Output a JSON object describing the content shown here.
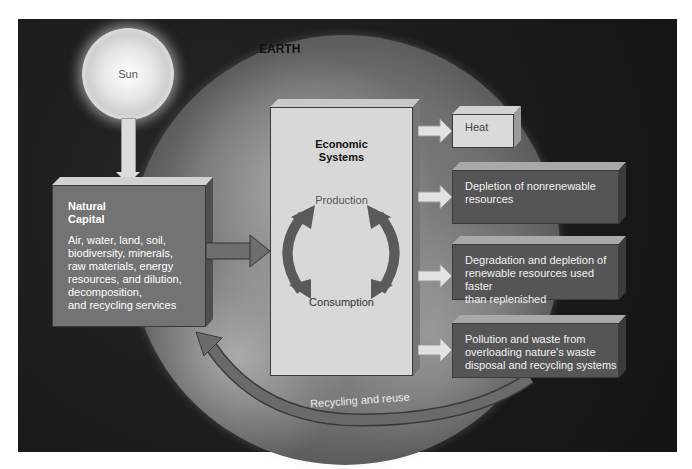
{
  "labels": {
    "sun": "Sun",
    "earth": "EARTH",
    "natural_capital": {
      "title": "Natural\nCapital",
      "title_line1": "Natural",
      "title_line2": "Capital",
      "description": "Air, water, land, soil,\nbiodiversity, minerals,\nraw materials, energy\nresources, and dilution,\ndecomposition,\nand recycling services"
    },
    "economic_systems": {
      "title_line1": "Economic",
      "title_line2": "Systems",
      "production": "Production",
      "consumption": "Consumption"
    },
    "outputs": [
      {
        "text": "Heat",
        "style": "light"
      },
      {
        "text": "Depletion of nonrenewable\nresources",
        "style": "dark"
      },
      {
        "text": "Degradation and  depletion of\nrenewable resources used faster\nthan replenished",
        "style": "dark"
      },
      {
        "text": "Pollution and waste from\noverloading  nature's waste\ndisposal  and recycling systems",
        "style": "dark"
      }
    ],
    "recycling": "Recycling and reuse"
  },
  "colors": {
    "background": "#1c1c1c",
    "natural_box": "#737373",
    "economic_box": "#d8d8d8",
    "dark_output_box": "#555555",
    "light_output_box": "#dadada",
    "cycle_arrows": "#5a5a5a",
    "recycle_arrow": "#6a6a6a"
  }
}
